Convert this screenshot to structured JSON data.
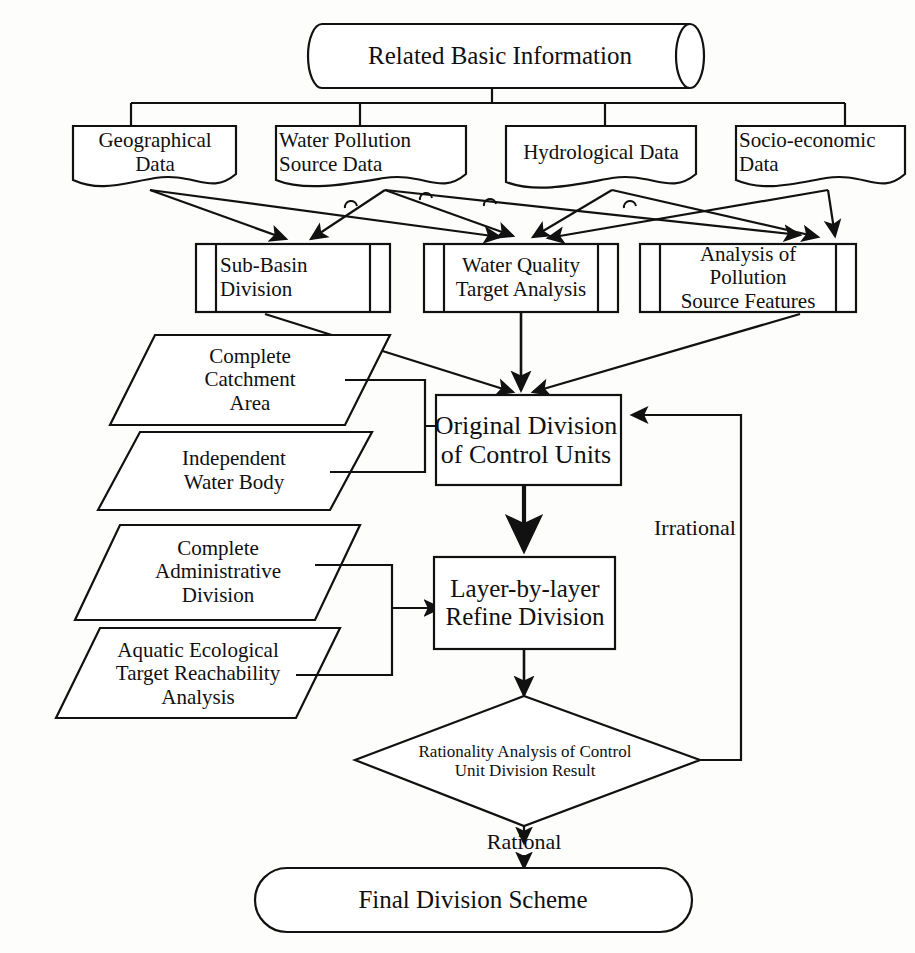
{
  "diagram": {
    "stroke_color": "#111111",
    "fill_color": "#ffffff",
    "background_color": "#fdfdfb"
  },
  "nodes": {
    "source": {
      "label": "Related Basic Information",
      "shape": "cylinder"
    },
    "inputs": [
      {
        "label": "Geographical\nData",
        "shape": "document"
      },
      {
        "label": "Water       Pollution\nSource Data",
        "shape": "document"
      },
      {
        "label": "Hydrological  Data",
        "shape": "document"
      },
      {
        "label": "Socio-economic\nData",
        "shape": "document"
      }
    ],
    "analyses": [
      {
        "label": "Sub-Basin\nDivision",
        "shape": "predefined-process"
      },
      {
        "label": "Water Quality\nTarget Analysis",
        "shape": "predefined-process"
      },
      {
        "label": "Analysis of Pollution\nSource Features",
        "shape": "predefined-process"
      }
    ],
    "criteria_upper": [
      {
        "label": "Complete\nCatchment\nArea",
        "shape": "parallelogram"
      },
      {
        "label": "Independent\nWater Body",
        "shape": "parallelogram"
      }
    ],
    "criteria_lower": [
      {
        "label": "Complete\nAdministrative\nDivision",
        "shape": "parallelogram"
      },
      {
        "label": "Aquatic Ecological\nTarget Reachability\nAnalysis",
        "shape": "parallelogram"
      }
    ],
    "original_division": {
      "label": "Original  Division\nof Control Units",
      "shape": "process"
    },
    "refine_division": {
      "label": "Layer-by-layer\nRefine Division",
      "shape": "process"
    },
    "decision": {
      "label": "Rationality Analysis of Control\nUnit Division Result",
      "shape": "diamond"
    },
    "final": {
      "label": "Final Division Scheme",
      "shape": "terminator"
    }
  },
  "edge_labels": {
    "irrational": "Irrational",
    "rational": "Rational"
  }
}
